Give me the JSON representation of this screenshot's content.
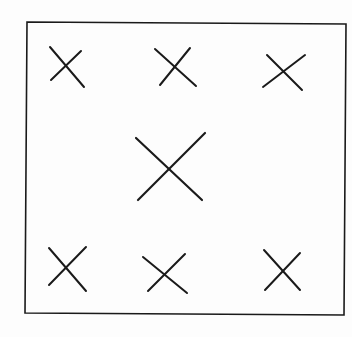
{
  "diagram": {
    "type": "marks-in-frame",
    "colors": {
      "background": "#fdfdfd",
      "stroke": "#1a1a1a"
    },
    "frame": {
      "points": [
        [
          27,
          22
        ],
        [
          346,
          24
        ],
        [
          344,
          315
        ],
        [
          25,
          313
        ]
      ],
      "stroke_width": 1.6
    },
    "marks": [
      {
        "id": "top-left",
        "size": "small",
        "lines": [
          [
            50,
            47,
            84,
            87
          ],
          [
            51,
            80,
            81,
            51
          ]
        ]
      },
      {
        "id": "top-center",
        "size": "small",
        "lines": [
          [
            155,
            49,
            196,
            86
          ],
          [
            160,
            85,
            190,
            48
          ]
        ]
      },
      {
        "id": "top-right",
        "size": "small",
        "lines": [
          [
            267,
            55,
            302,
            90
          ],
          [
            263,
            87,
            305,
            55
          ]
        ]
      },
      {
        "id": "center",
        "size": "large",
        "lines": [
          [
            136,
            138,
            202,
            200
          ],
          [
            138,
            200,
            205,
            133
          ]
        ]
      },
      {
        "id": "bottom-left",
        "size": "small",
        "lines": [
          [
            49,
            248,
            86,
            291
          ],
          [
            49,
            285,
            86,
            247
          ]
        ]
      },
      {
        "id": "bottom-center",
        "size": "small",
        "lines": [
          [
            143,
            257,
            187,
            293
          ],
          [
            148,
            291,
            185,
            254
          ]
        ]
      },
      {
        "id": "bottom-right",
        "size": "small",
        "lines": [
          [
            264,
            250,
            300,
            290
          ],
          [
            265,
            290,
            300,
            253
          ]
        ]
      }
    ]
  }
}
